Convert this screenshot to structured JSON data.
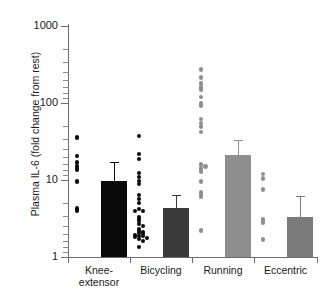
{
  "chart_data": {
    "type": "bar",
    "title": "",
    "xlabel": "",
    "ylabel": "Plasma IL-6 (fold change from rest)",
    "yscale": "log",
    "ylim": [
      1,
      1000
    ],
    "ytick_labels": [
      "1000",
      "100",
      "10",
      "1"
    ],
    "ytick_values": [
      1000,
      100,
      10,
      1
    ],
    "grid": false,
    "legend": "none",
    "categories": [
      "Knee-extensor",
      "Bicycling",
      "Running",
      "Eccentric"
    ],
    "series": [
      {
        "name": "Mean fold change",
        "values": [
          9.7,
          4.3,
          21.0,
          3.3
        ],
        "errors_upper": [
          17.0,
          6.3,
          33.0,
          6.2
        ],
        "colors": [
          "#0a0a0a",
          "#3a3a3a",
          "#8e8e8e",
          "#7a7a7a"
        ]
      }
    ],
    "scatter": [
      {
        "group": "Knee-extensor",
        "color": "#0a0a0a",
        "values": [
          36.0,
          20.5,
          17.0,
          15.0,
          13.8,
          9.5,
          4.3,
          4.0
        ]
      },
      {
        "group": "Bicycling",
        "color": "#0a0a0a",
        "values": [
          37.0,
          22.0,
          19.0,
          12.5,
          11.0,
          9.8,
          8.8,
          6.3,
          5.6,
          5.0,
          4.2,
          4.0,
          3.9,
          3.3,
          3.1,
          2.9,
          2.7,
          2.5,
          2.3,
          2.2,
          2.1,
          2.05,
          2.0,
          1.95,
          1.9,
          1.85,
          1.8,
          1.75,
          1.7,
          1.6,
          1.35
        ]
      },
      {
        "group": "Running",
        "color": "#8e8e8e",
        "values": [
          270.0,
          215.0,
          180.0,
          160.0,
          150.0,
          120.0,
          100.0,
          92.0,
          62.0,
          55.0,
          50.0,
          42.0,
          16.0,
          15.0,
          14.0,
          13.0,
          9.5,
          6.8,
          6.4,
          6.0,
          2.2
        ]
      },
      {
        "group": "Eccentric",
        "color": "#8e8e8e",
        "values": [
          12.0,
          10.5,
          7.6,
          3.1,
          2.8,
          1.7
        ]
      }
    ]
  },
  "axis": {
    "y_title": "Plasma IL-6 (fold change from rest)",
    "y_labels": {
      "t1000": "1000",
      "t100": "100",
      "t10": "10",
      "t1": "1"
    },
    "x_labels": {
      "g1_line1": "Knee-",
      "g1_line2": "extensor",
      "g2": "Bicycling",
      "g3": "Running",
      "g4": "Eccentric"
    }
  }
}
